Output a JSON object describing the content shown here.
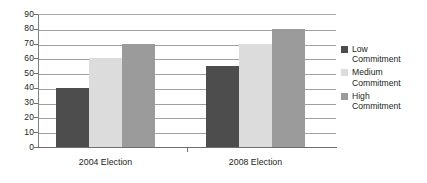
{
  "chart_data": {
    "type": "bar",
    "title": "",
    "xlabel": "",
    "ylabel": "",
    "categories": [
      "2004 Election",
      "2008 Election"
    ],
    "series": [
      {
        "name": "Low Commitment",
        "color": "#4d4d4d",
        "values": [
          40,
          55
        ]
      },
      {
        "name": "Medium Commitment",
        "color": "#dcdcdc",
        "values": [
          60,
          70
        ]
      },
      {
        "name": "High Commitment",
        "color": "#9b9b9b",
        "values": [
          70,
          80
        ]
      }
    ],
    "ylim": [
      0,
      90
    ],
    "ytick_step": 10,
    "yticks": [
      "90",
      "80",
      "70",
      "60",
      "50",
      "40",
      "30",
      "20",
      "10",
      "0"
    ],
    "grid": true,
    "legend_position": "right"
  },
  "axis": {
    "y_ticks": [
      {
        "label": "90",
        "value": 90
      },
      {
        "label": "80",
        "value": 80
      },
      {
        "label": "70",
        "value": 70
      },
      {
        "label": "60",
        "value": 60
      },
      {
        "label": "50",
        "value": 50
      },
      {
        "label": "40",
        "value": 40
      },
      {
        "label": "30",
        "value": 30
      },
      {
        "label": "20",
        "value": 20
      },
      {
        "label": "10",
        "value": 10
      },
      {
        "label": "0",
        "value": 0
      }
    ],
    "x_categories": [
      {
        "label": "2004 Election"
      },
      {
        "label": "2008 Election"
      }
    ]
  },
  "legend": {
    "items": [
      {
        "key": "low",
        "line1": "Low",
        "line2": "Commitment",
        "color": "#4d4d4d"
      },
      {
        "key": "medium",
        "line1": "Medium",
        "line2": "Commitment",
        "color": "#dcdcdc"
      },
      {
        "key": "high",
        "line1": "High",
        "line2": "Commitment",
        "color": "#9b9b9b"
      }
    ]
  },
  "colors": {
    "low": "#4d4d4d",
    "medium": "#dcdcdc",
    "high": "#9b9b9b",
    "gridline": "#a0a0a0",
    "axis": "#6e6e6e",
    "text": "#231f20",
    "background": "#ffffff"
  }
}
